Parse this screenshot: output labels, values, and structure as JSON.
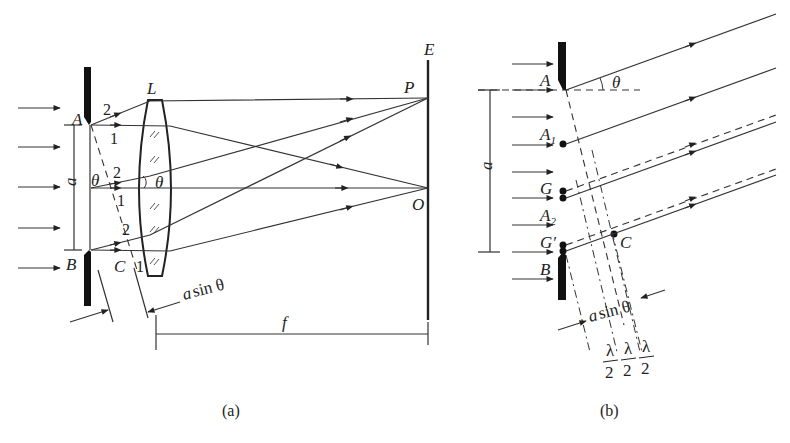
{
  "figure_a": {
    "caption": "(a)",
    "labels": {
      "lens": "L",
      "screen": "E",
      "point_p": "P",
      "point_o": "O",
      "edge_a": "A",
      "edge_b": "B",
      "point_c": "C",
      "width": "a",
      "angle1": "θ",
      "angle2": "θ",
      "focal": "f",
      "path_diff_a": "a",
      "path_diff_rest": "sin θ"
    },
    "ray_numbers": [
      "2",
      "1",
      "2",
      "1",
      "2",
      "1"
    ]
  },
  "figure_b": {
    "caption": "(b)",
    "labels": {
      "edge_a": "A",
      "edge_b": "B",
      "a1": "A",
      "a1_sub": "1",
      "a2": "A",
      "a2_sub": "2",
      "g": "G",
      "g_prime": "G′",
      "point_c": "C",
      "width": "a",
      "angle": "θ",
      "path_diff_a": "a",
      "path_diff_rest": "sin θ",
      "half_wave_num": "λ",
      "half_wave_den": "2"
    }
  }
}
